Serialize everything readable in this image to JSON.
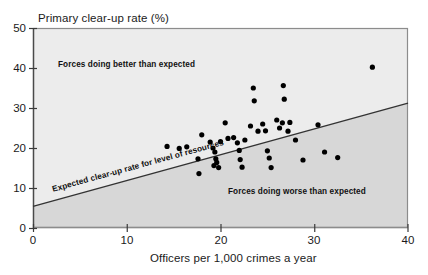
{
  "chart_data": {
    "type": "scatter",
    "title": "",
    "ylabel": "Primary clear-up rate (%)",
    "xlabel": "Officers per 1,000 crimes a year",
    "xlim": [
      0,
      40
    ],
    "ylim": [
      0,
      50
    ],
    "xticks": [
      0,
      10,
      20,
      30,
      40
    ],
    "yticks": [
      0,
      10,
      20,
      30,
      40,
      50
    ],
    "xtick_labels": [
      "0",
      "10",
      "20",
      "30",
      "40"
    ],
    "ytick_labels": [
      "0",
      "10",
      "20",
      "30",
      "40",
      "50"
    ],
    "grid": false,
    "legend": "none",
    "annotations": [
      {
        "id": "above-line",
        "text": "Forces doing better than expected",
        "x": 7.0,
        "y": 40.5
      },
      {
        "id": "below-line",
        "text": "Forces doing worse than expected",
        "x": 24.0,
        "y": 9.5
      },
      {
        "id": "trend-line",
        "text": "Expected clear-up rate for level of resources",
        "x": 2.0,
        "y": 10.0
      }
    ],
    "series": [
      {
        "name": "Police forces",
        "marker": "circle",
        "color": "#000000",
        "points": [
          [
            14.3,
            20.4
          ],
          [
            15.6,
            19.9
          ],
          [
            16.4,
            20.3
          ],
          [
            17.6,
            17.3
          ],
          [
            17.7,
            13.6
          ],
          [
            18.0,
            23.3
          ],
          [
            18.9,
            21.5
          ],
          [
            19.2,
            20.0
          ],
          [
            19.4,
            19.0
          ],
          [
            19.5,
            17.3
          ],
          [
            19.6,
            16.4
          ],
          [
            19.3,
            15.6
          ],
          [
            19.8,
            15.1
          ],
          [
            20.0,
            21.6
          ],
          [
            20.5,
            26.3
          ],
          [
            20.8,
            22.4
          ],
          [
            21.4,
            22.6
          ],
          [
            21.8,
            21.3
          ],
          [
            22.0,
            19.4
          ],
          [
            22.1,
            17.1
          ],
          [
            22.3,
            15.2
          ],
          [
            22.6,
            22.0
          ],
          [
            23.2,
            25.5
          ],
          [
            23.5,
            35.0
          ],
          [
            23.6,
            31.8
          ],
          [
            24.0,
            24.2
          ],
          [
            24.5,
            26.0
          ],
          [
            24.8,
            24.3
          ],
          [
            25.0,
            19.3
          ],
          [
            25.2,
            17.5
          ],
          [
            25.4,
            15.1
          ],
          [
            26.0,
            27.0
          ],
          [
            26.3,
            25.0
          ],
          [
            26.6,
            26.3
          ],
          [
            26.7,
            35.6
          ],
          [
            26.8,
            32.2
          ],
          [
            27.2,
            24.2
          ],
          [
            27.4,
            26.4
          ],
          [
            28.0,
            22.0
          ],
          [
            28.8,
            17.0
          ],
          [
            30.4,
            25.8
          ],
          [
            31.1,
            19.0
          ],
          [
            32.5,
            17.6
          ],
          [
            36.2,
            40.2
          ]
        ]
      }
    ],
    "trend_line": {
      "name": "Expected clear-up rate for level of resources",
      "x_start": 0,
      "y_start": 5.4,
      "x_end": 40,
      "y_end": 31.2,
      "color": "#333333"
    },
    "shaded_region": {
      "name": "below-expected",
      "color": "#d7d7d7"
    },
    "plot_background": "#ececec",
    "border_color": "#8c8c8c"
  }
}
